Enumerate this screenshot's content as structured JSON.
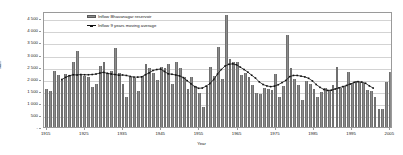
{
  "chart_data": {
    "type": "bar",
    "title": "",
    "xlabel": "Year",
    "ylabel": "Mm³",
    "xlim": [
      1914.3,
      2005.7
    ],
    "ylim": [
      0,
      4800
    ],
    "grid": true,
    "legend_position": "top-left-inside",
    "y_ticks": [
      "-",
      "500",
      "1 000",
      "1 500",
      "2 000",
      "2 500",
      "3 000",
      "3 500",
      "4 000",
      "4 500"
    ],
    "y_tick_values": [
      0,
      500,
      1000,
      1500,
      2000,
      2500,
      3000,
      3500,
      4000,
      4500
    ],
    "x_ticks": [
      "1915",
      "1925",
      "1935",
      "1945",
      "1955",
      "1965",
      "1975",
      "1985",
      "1995",
      "2005"
    ],
    "x_tick_values": [
      1915,
      1925,
      1935,
      1945,
      1955,
      1965,
      1975,
      1985,
      1995,
      2005
    ],
    "series": [
      {
        "name": "Inflow Bhavanagar reservoir",
        "type": "bar",
        "color": "#8c8c8c",
        "x": [
          1915,
          1916,
          1917,
          1918,
          1919,
          1920,
          1921,
          1922,
          1923,
          1924,
          1925,
          1926,
          1927,
          1928,
          1929,
          1930,
          1931,
          1932,
          1933,
          1934,
          1935,
          1936,
          1937,
          1938,
          1939,
          1940,
          1941,
          1942,
          1943,
          1944,
          1945,
          1946,
          1947,
          1948,
          1949,
          1950,
          1951,
          1952,
          1953,
          1954,
          1955,
          1956,
          1957,
          1958,
          1959,
          1960,
          1961,
          1962,
          1963,
          1964,
          1965,
          1966,
          1967,
          1968,
          1969,
          1970,
          1971,
          1972,
          1973,
          1974,
          1975,
          1976,
          1977,
          1978,
          1979,
          1980,
          1981,
          1982,
          1983,
          1984,
          1985,
          1986,
          1987,
          1988,
          1989,
          1990,
          1991,
          1992,
          1993,
          1994,
          1995,
          1996,
          1997,
          1998,
          1999,
          2000,
          2001,
          2002,
          2003,
          2004,
          2005
        ],
        "values": [
          1560,
          1470,
          2300,
          2150,
          1960,
          2180,
          2150,
          2680,
          3130,
          2170,
          2130,
          2090,
          1670,
          1800,
          2530,
          2700,
          2250,
          2320,
          3280,
          2230,
          1790,
          1250,
          2060,
          2010,
          1480,
          2100,
          2620,
          2450,
          2230,
          1950,
          2500,
          2440,
          2620,
          1760,
          2710,
          2440,
          2060,
          1560,
          2050,
          1690,
          1390,
          820,
          1700,
          2480,
          2130,
          3330,
          1990,
          4650,
          2800,
          2680,
          2700,
          2150,
          2250,
          2060,
          1740,
          1390,
          1350,
          1600,
          1570,
          1520,
          2210,
          1240,
          1710,
          3800,
          2450,
          2000,
          1720,
          1130,
          1900,
          1760,
          1560,
          1260,
          1440,
          1600,
          1540,
          1740,
          2480,
          1620,
          1700,
          2280,
          1810,
          1900,
          1870,
          1820,
          1540,
          1480,
          1230,
          740,
          740,
          1870,
          2280
        ]
      },
      {
        "name": "Inflow 9 years moving average",
        "type": "line",
        "color": "#111111",
        "marker": "square",
        "x": [
          1919,
          1920,
          1921,
          1922,
          1923,
          1924,
          1925,
          1926,
          1927,
          1928,
          1929,
          1930,
          1931,
          1932,
          1933,
          1934,
          1935,
          1936,
          1937,
          1938,
          1939,
          1940,
          1941,
          1942,
          1943,
          1944,
          1945,
          1946,
          1947,
          1948,
          1949,
          1950,
          1951,
          1952,
          1953,
          1954,
          1955,
          1956,
          1957,
          1958,
          1959,
          1960,
          1961,
          1962,
          1963,
          1964,
          1965,
          1966,
          1967,
          1968,
          1969,
          1970,
          1971,
          1972,
          1973,
          1974,
          1975,
          1976,
          1977,
          1978,
          1979,
          1980,
          1981,
          1982,
          1983,
          1984,
          1985,
          1986,
          1987,
          1988,
          1989,
          1990,
          1991,
          1992,
          1993,
          1994,
          1995,
          1996,
          1997,
          1998,
          1999,
          2000,
          2001
        ],
        "values": [
          2000,
          2090,
          2160,
          2200,
          2190,
          2210,
          2200,
          2200,
          2210,
          2230,
          2270,
          2300,
          2260,
          2230,
          2210,
          2180,
          2190,
          2170,
          2130,
          2100,
          2100,
          2110,
          2200,
          2280,
          2380,
          2420,
          2440,
          2340,
          2240,
          2220,
          2190,
          2150,
          2080,
          1950,
          1820,
          1700,
          1630,
          1640,
          1720,
          1830,
          2000,
          2230,
          2420,
          2570,
          2640,
          2660,
          2620,
          2520,
          2420,
          2310,
          2180,
          2060,
          1900,
          1790,
          1730,
          1700,
          1720,
          1780,
          1870,
          1960,
          2120,
          2170,
          2170,
          2140,
          2110,
          2050,
          1940,
          1790,
          1670,
          1580,
          1540,
          1550,
          1600,
          1650,
          1700,
          1750,
          1810,
          1880,
          1910,
          1890,
          1840,
          1730,
          1640
        ]
      }
    ]
  },
  "legend": {
    "bar_label": "Inflow Bhavanagar reservoir",
    "line_label": "Inflow 9 years moving average"
  },
  "axes": {
    "x_title": "Year",
    "y_title": "Mm³"
  },
  "colors": {
    "bar_fill": "#8c8c8c",
    "bar_edge": "#6f6f6f",
    "line": "#111111",
    "grid": "#d3d3d3",
    "frame": "#9a9a9a",
    "background": "#ffffff"
  }
}
